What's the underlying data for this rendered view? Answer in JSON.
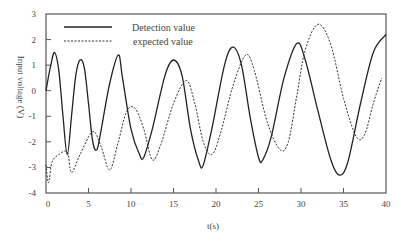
{
  "chart_data": {
    "type": "line",
    "title": "",
    "xlabel": "t(s)",
    "ylabel": "Input voltage (V)",
    "xlim": [
      0,
      40
    ],
    "ylim": [
      -4,
      3
    ],
    "x_ticks": [
      0,
      5,
      10,
      15,
      20,
      25,
      30,
      35,
      40
    ],
    "y_ticks": [
      3,
      2,
      1,
      0,
      -1,
      -2,
      -3,
      -4
    ],
    "grid": false,
    "legend_position": "upper-left",
    "series": [
      {
        "name": "Detection value",
        "style": "solid",
        "points": [
          [
            0,
            0
          ],
          [
            0.5,
            0.9
          ],
          [
            1,
            1.5
          ],
          [
            1.5,
            0.8
          ],
          [
            2,
            -1
          ],
          [
            2.5,
            -2.5
          ],
          [
            3,
            -1
          ],
          [
            3.5,
            0.6
          ],
          [
            4,
            1.2
          ],
          [
            4.5,
            0.9
          ],
          [
            5,
            -0.5
          ],
          [
            5.5,
            -2.0
          ],
          [
            6,
            -2.3
          ],
          [
            6.5,
            -1.5
          ],
          [
            7.5,
            0.3
          ],
          [
            8.5,
            1.4
          ],
          [
            9,
            0.5
          ],
          [
            10,
            -1.5
          ],
          [
            11,
            -2.5
          ],
          [
            11.5,
            -2.6
          ],
          [
            12.5,
            -1.5
          ],
          [
            14,
            0.6
          ],
          [
            15,
            1.2
          ],
          [
            16,
            0.6
          ],
          [
            17,
            -1.5
          ],
          [
            18,
            -2.8
          ],
          [
            18.5,
            -2.9
          ],
          [
            19.5,
            -1.5
          ],
          [
            21,
            1.0
          ],
          [
            22,
            1.7
          ],
          [
            23,
            1.0
          ],
          [
            24,
            -1.0
          ],
          [
            25,
            -2.6
          ],
          [
            25.5,
            -2.7
          ],
          [
            26.5,
            -1.8
          ],
          [
            28,
            0.5
          ],
          [
            29.5,
            1.85
          ],
          [
            30.5,
            1.2
          ],
          [
            32,
            -0.8
          ],
          [
            33.5,
            -2.7
          ],
          [
            34.5,
            -3.3
          ],
          [
            35.5,
            -2.8
          ],
          [
            37,
            -0.5
          ],
          [
            38.5,
            1.5
          ],
          [
            40,
            2.2
          ]
        ]
      },
      {
        "name": "expected value",
        "style": "dashed",
        "points": [
          [
            0,
            -2.9
          ],
          [
            0.3,
            -3.6
          ],
          [
            0.7,
            -2.8
          ],
          [
            1.5,
            -2.5
          ],
          [
            2.5,
            -2.4
          ],
          [
            3,
            -3.2
          ],
          [
            4,
            -2.5
          ],
          [
            5.5,
            -1.6
          ],
          [
            6.5,
            -2.2
          ],
          [
            7.5,
            -3.1
          ],
          [
            8.5,
            -2.0
          ],
          [
            9.5,
            -0.8
          ],
          [
            10.5,
            -0.7
          ],
          [
            11.5,
            -1.5
          ],
          [
            12.5,
            -2.7
          ],
          [
            13.5,
            -2.1
          ],
          [
            15,
            -0.5
          ],
          [
            16.5,
            0.4
          ],
          [
            17.5,
            -0.5
          ],
          [
            18.5,
            -2.0
          ],
          [
            19.5,
            -2.5
          ],
          [
            20.5,
            -1.7
          ],
          [
            22,
            0.2
          ],
          [
            23.5,
            1.4
          ],
          [
            24.5,
            0.8
          ],
          [
            26,
            -1.2
          ],
          [
            27.5,
            -2.3
          ],
          [
            28.5,
            -2.0
          ],
          [
            29.5,
            -0.2
          ],
          [
            30.5,
            1.6
          ],
          [
            32,
            2.6
          ],
          [
            33.5,
            1.8
          ],
          [
            35,
            -0.3
          ],
          [
            36.5,
            -1.8
          ],
          [
            37.5,
            -1.7
          ],
          [
            38.5,
            -0.5
          ],
          [
            39.5,
            0.5
          ]
        ]
      }
    ]
  },
  "legend": {
    "items": [
      {
        "label": "Detection value",
        "style": "solid"
      },
      {
        "label": "expected value",
        "style": "dashed"
      }
    ]
  },
  "axes": {
    "xlabel": "t(s)",
    "ylabel": "Input voltage (V)",
    "colors": {
      "axis": "#555555",
      "solid": "#222222",
      "dashed": "#333333",
      "text": "#444444"
    }
  }
}
